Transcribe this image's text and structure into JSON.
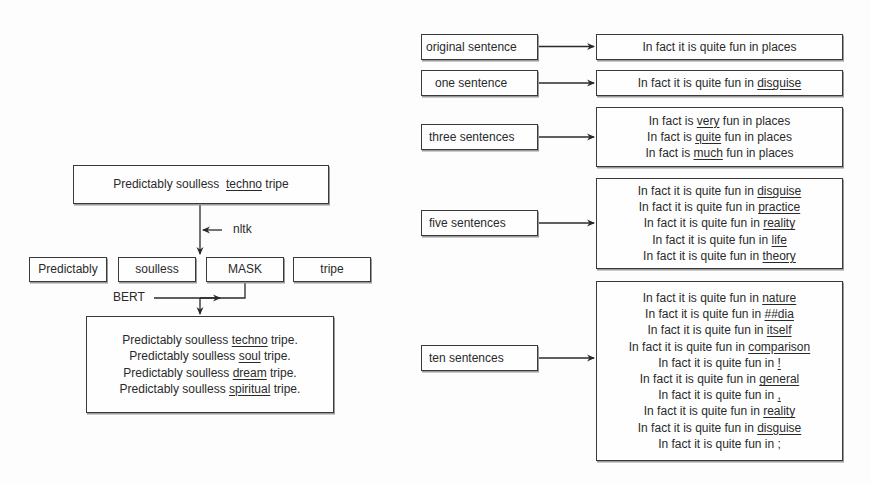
{
  "left_diagram": {
    "input_sentence": {
      "prefix": "Predictably soulless ",
      "masked_word": "techno",
      "suffix": " tripe"
    },
    "tokenizer_label": "nltk",
    "tokens": [
      "Predictably",
      "soulless",
      "MASK",
      "tripe"
    ],
    "model_label": "BERT",
    "outputs": [
      {
        "prefix": "Predictably soulless ",
        "word": "techno",
        "suffix": " tripe."
      },
      {
        "prefix": "Predictably soulless ",
        "word": "soul",
        "suffix": " tripe."
      },
      {
        "prefix": "Predictably soulless ",
        "word": "dream",
        "suffix": " tripe."
      },
      {
        "prefix": "Predictably soulless ",
        "word": "spiritual",
        "suffix": " tripe."
      }
    ]
  },
  "right_diagram": {
    "rows": [
      {
        "label": "original sentence",
        "sentences": [
          {
            "prefix": "In fact it is quite fun in places",
            "word": ""
          }
        ]
      },
      {
        "label": "one sentence",
        "sentences": [
          {
            "prefix": "In fact it is quite fun in ",
            "word": "disguise"
          }
        ]
      },
      {
        "label": "three sentences",
        "sentences": [
          {
            "prefix": "In fact is ",
            "word": "very",
            "suffix": " fun in places"
          },
          {
            "prefix": "In fact is ",
            "word": "quite",
            "suffix": " fun in places"
          },
          {
            "prefix": "In fact is ",
            "word": "much",
            "suffix": " fun in places"
          }
        ]
      },
      {
        "label": "five sentences",
        "sentences": [
          {
            "prefix": "In fact it is quite fun in ",
            "word": "disguise"
          },
          {
            "prefix": "In fact it is quite fun in ",
            "word": "practice"
          },
          {
            "prefix": "In fact it is quite fun in ",
            "word": "reality"
          },
          {
            "prefix": "In fact it is quite fun in ",
            "word": "life"
          },
          {
            "prefix": "In fact it is quite fun in ",
            "word": "theory"
          }
        ]
      },
      {
        "label": "ten sentences",
        "sentences": [
          {
            "prefix": "In fact it is quite fun in ",
            "word": "nature"
          },
          {
            "prefix": "In fact it is quite fun in ",
            "word": "##dia"
          },
          {
            "prefix": "In fact it is quite fun in ",
            "word": "itself"
          },
          {
            "prefix": "In fact it is quite fun in ",
            "word": "comparison"
          },
          {
            "prefix": "In fact it is quite fun in ",
            "word": "!"
          },
          {
            "prefix": "In fact it is quite fun in ",
            "word": "general"
          },
          {
            "prefix": "In fact it is quite fun in ",
            "word": ","
          },
          {
            "prefix": "In fact it is quite fun in ",
            "word": "reality"
          },
          {
            "prefix": "In fact it is quite fun in ",
            "word": "disguise"
          },
          {
            "prefix": "In fact it is quite fun in ",
            "word": "",
            "suffix": ";"
          }
        ]
      }
    ]
  }
}
